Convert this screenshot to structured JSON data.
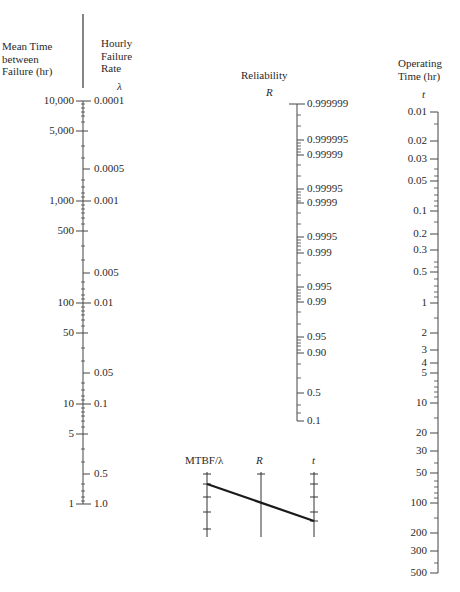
{
  "headers": {
    "mtbf": "Mean Time\nbetween\nFailure (hr)",
    "failure_rate": "Hourly\nFailure\nRate",
    "reliability": "Reliability",
    "operating_time": "Operating\nTime (hr)"
  },
  "symbols": {
    "lambda": "λ",
    "R": "R",
    "t": "t"
  },
  "mtbf_scale": [
    {
      "label": "10,000",
      "y": 101
    },
    {
      "label": "5,000",
      "y": 131
    },
    {
      "label": "1,000",
      "y": 201
    },
    {
      "label": "500",
      "y": 231
    },
    {
      "label": "100",
      "y": 303
    },
    {
      "label": "50",
      "y": 333
    },
    {
      "label": "10",
      "y": 404
    },
    {
      "label": "5",
      "y": 434
    },
    {
      "label": "1",
      "y": 504
    }
  ],
  "lambda_scale": [
    {
      "label": "0.0001",
      "y": 101
    },
    {
      "label": "0.0005",
      "y": 169
    },
    {
      "label": "0.001",
      "y": 201
    },
    {
      "label": "0.005",
      "y": 273
    },
    {
      "label": "0.01",
      "y": 303
    },
    {
      "label": "0.05",
      "y": 373
    },
    {
      "label": "0.1",
      "y": 404
    },
    {
      "label": "0.5",
      "y": 474
    },
    {
      "label": "1.0",
      "y": 504
    }
  ],
  "reliability_scale": [
    {
      "label": "0.999999",
      "y": 104
    },
    {
      "label": "0.999995",
      "y": 140
    },
    {
      "label": "0.99999",
      "y": 155
    },
    {
      "label": "0.99995",
      "y": 189
    },
    {
      "label": "0.9999",
      "y": 203
    },
    {
      "label": "0.9995",
      "y": 237
    },
    {
      "label": "0.999",
      "y": 253
    },
    {
      "label": "0.995",
      "y": 287
    },
    {
      "label": "0.99",
      "y": 302
    },
    {
      "label": "0.95",
      "y": 337
    },
    {
      "label": "0.90",
      "y": 353
    },
    {
      "label": "0.5",
      "y": 393
    },
    {
      "label": "0.1",
      "y": 421
    }
  ],
  "time_scale": [
    {
      "label": "0.01",
      "y": 112
    },
    {
      "label": "0.02",
      "y": 141
    },
    {
      "label": "0.03",
      "y": 159
    },
    {
      "label": "0.05",
      "y": 181
    },
    {
      "label": "0.1",
      "y": 211
    },
    {
      "label": "0.2",
      "y": 234
    },
    {
      "label": "0.3",
      "y": 250
    },
    {
      "label": "0.5",
      "y": 272
    },
    {
      "label": "1",
      "y": 303
    },
    {
      "label": "2",
      "y": 333
    },
    {
      "label": "3",
      "y": 350
    },
    {
      "label": "4",
      "y": 363
    },
    {
      "label": "5",
      "y": 373
    },
    {
      "label": "10",
      "y": 403
    },
    {
      "label": "20",
      "y": 433
    },
    {
      "label": "30",
      "y": 451
    },
    {
      "label": "50",
      "y": 473
    },
    {
      "label": "100",
      "y": 503
    },
    {
      "label": "200",
      "y": 533
    },
    {
      "label": "300",
      "y": 551
    },
    {
      "label": "500",
      "y": 573
    }
  ],
  "inset": {
    "label_left": "MTBF/λ",
    "label_mid": "R",
    "label_right": "t"
  }
}
